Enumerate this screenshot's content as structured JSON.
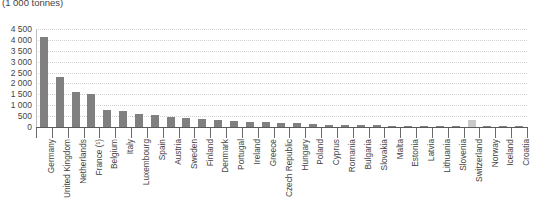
{
  "chart_data": {
    "type": "bar",
    "title": "(1 000 tonnes)",
    "subtitle": "",
    "xlabel": "",
    "ylabel": "",
    "ylim": [
      0,
      4500
    ],
    "ytick_values": [
      0,
      500,
      1000,
      1500,
      2000,
      2500,
      3000,
      3500,
      4000,
      4500
    ],
    "ytick_labels": [
      "0",
      "500",
      "1 000",
      "1 500",
      "2 000",
      "2 500",
      "3 000",
      "3 500",
      "4 000",
      "4 500"
    ],
    "grid": true,
    "grid_axis": "y",
    "legend": null,
    "bar_color": "#808080",
    "highlight_color": "#c9c9c9",
    "highlighted_category": "Switzerland",
    "categories": [
      "Germany",
      "United Kingdom",
      "Netherlands",
      "France (¹)",
      "Belgium",
      "Italy",
      "Luxembourg",
      "Spain",
      "Austria",
      "Sweden",
      "Finland",
      "Denmark",
      "Portugal",
      "Ireland",
      "Greece",
      "Czech Republic",
      "Hungary",
      "Poland",
      "Cyprus",
      "Romania",
      "Bulgaria",
      "Slovakia",
      "Malta",
      "Estonia",
      "Latvia",
      "Lithuania",
      "Slovenia",
      "Switzerland",
      "Norway",
      "Iceland",
      "Croatia"
    ],
    "values": [
      4150,
      2300,
      1600,
      1520,
      800,
      720,
      620,
      560,
      440,
      410,
      370,
      330,
      290,
      250,
      220,
      200,
      170,
      140,
      115,
      95,
      80,
      70,
      60,
      50,
      40,
      35,
      30,
      330,
      60,
      40,
      25
    ]
  }
}
